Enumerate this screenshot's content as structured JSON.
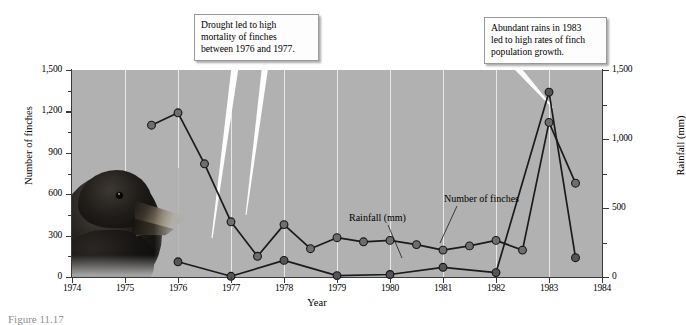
{
  "chart_data": {
    "type": "line",
    "title": "",
    "xlabel": "Year",
    "ylabel": "Number of finches",
    "y2label": "Rainfall (mm)",
    "xlim": [
      1974,
      1984
    ],
    "ylim": [
      0,
      1500
    ],
    "y2lim": [
      0,
      1500
    ],
    "grid": "vertical-white-at-year-ticks",
    "plot_background": "#b1b1b1",
    "legend": "in-plot labels with leader lines",
    "x_ticks": [
      1974,
      1975,
      1976,
      1977,
      1978,
      1979,
      1980,
      1981,
      1982,
      1983,
      1984
    ],
    "x_tick_labels": [
      "1974",
      "1975",
      "1976",
      "1977",
      "1978",
      "1979",
      "1980",
      "1981",
      "1982",
      "1983",
      "1984"
    ],
    "y_ticks_left": [
      0,
      300,
      600,
      900,
      1200,
      1500
    ],
    "y_tick_labels_left": [
      "0",
      "300",
      "600",
      "900",
      "1,200",
      "1,500"
    ],
    "y_minor_ticks_left": [
      150,
      450,
      750,
      1050,
      1350
    ],
    "y_ticks_right": [
      0,
      500,
      1000,
      1500
    ],
    "y_tick_labels_right": [
      "0",
      "500",
      "1,000",
      "1,500"
    ],
    "y_minor_ticks_right": [
      250,
      750,
      1250
    ],
    "series": [
      {
        "name": "Number of finches",
        "axis": "left",
        "marker": "filled-circle",
        "color": "#6e6e6e",
        "points": [
          {
            "x": 1975.5,
            "y": 1100
          },
          {
            "x": 1976.0,
            "y": 1190
          },
          {
            "x": 1976.5,
            "y": 820
          },
          {
            "x": 1977.0,
            "y": 400
          },
          {
            "x": 1977.5,
            "y": 150
          },
          {
            "x": 1978.0,
            "y": 380
          },
          {
            "x": 1978.5,
            "y": 205
          },
          {
            "x": 1979.0,
            "y": 285
          },
          {
            "x": 1979.5,
            "y": 255
          },
          {
            "x": 1980.0,
            "y": 265
          },
          {
            "x": 1980.5,
            "y": 235
          },
          {
            "x": 1981.0,
            "y": 195
          },
          {
            "x": 1981.5,
            "y": 225
          },
          {
            "x": 1982.0,
            "y": 265
          },
          {
            "x": 1982.5,
            "y": 195
          },
          {
            "x": 1983.0,
            "y": 1120
          },
          {
            "x": 1983.5,
            "y": 680
          }
        ]
      },
      {
        "name": "Rainfall (mm)",
        "axis": "right",
        "marker": "filled-circle",
        "color": "#555555",
        "points": [
          {
            "x": 1976.0,
            "y": 110
          },
          {
            "x": 1977.0,
            "y": 5
          },
          {
            "x": 1978.0,
            "y": 120
          },
          {
            "x": 1979.0,
            "y": 10
          },
          {
            "x": 1980.0,
            "y": 18
          },
          {
            "x": 1981.0,
            "y": 70
          },
          {
            "x": 1982.0,
            "y": 32
          },
          {
            "x": 1983.0,
            "y": 1340
          },
          {
            "x": 1983.5,
            "y": 140
          }
        ]
      }
    ],
    "annotations": [
      {
        "id": "drought",
        "text": "Drought led to high mortality of finches between 1976 and 1977.",
        "lines": [
          "Drought led to high",
          "mortality of finches",
          "between 1976 and 1977."
        ],
        "points_to": [
          "finches 1977 decline",
          "finches 1977.5 minimum"
        ]
      },
      {
        "id": "rains",
        "text": "Abundant rains in 1983 led to high rates of finch population growth.",
        "lines": [
          "Abundant rains in 1983",
          "led to high rates of finch",
          "population growth."
        ],
        "points_to": [
          "rainfall 1983 peak"
        ]
      }
    ],
    "inplot_labels": [
      {
        "id": "rainfall",
        "text": "Rainfall (mm)"
      },
      {
        "id": "finches",
        "text": "Number of finches"
      }
    ],
    "photo": {
      "subject": "darwin-finch-head",
      "position": "lower-left of plot area"
    }
  },
  "axes": {
    "left_title": "Number of finches",
    "right_title": "Rainfall (mm)",
    "x_title": "Year"
  },
  "caption": {
    "figure_number": "Figure 11.17",
    "text": "Figure 11.17"
  }
}
